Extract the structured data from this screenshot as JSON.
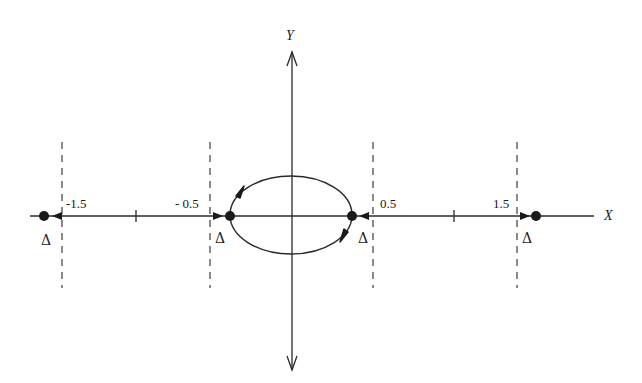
{
  "diagram": {
    "type": "phase portrait",
    "axes": {
      "x_label": "X",
      "y_label": "Y"
    },
    "tick_labels": [
      "-1.5",
      "- 0.5",
      "0.5",
      "1.5"
    ],
    "equilibrium_marker": "Δ",
    "equilibria": [
      {
        "x_label": "-1.5",
        "marker": "Δ"
      },
      {
        "x_label": "-0.5",
        "marker": "Δ"
      },
      {
        "x_label": "0.5",
        "marker": "Δ"
      },
      {
        "x_label": "1.5",
        "marker": "Δ"
      }
    ],
    "closed_orbit": "ellipse connecting the two inner equilibria, flow clockwise (upper arc left-to-right, lower arc right-to-left)",
    "dashed_lines_at": [
      "-1.5",
      "-0.5",
      "0.5",
      "1.5"
    ]
  }
}
